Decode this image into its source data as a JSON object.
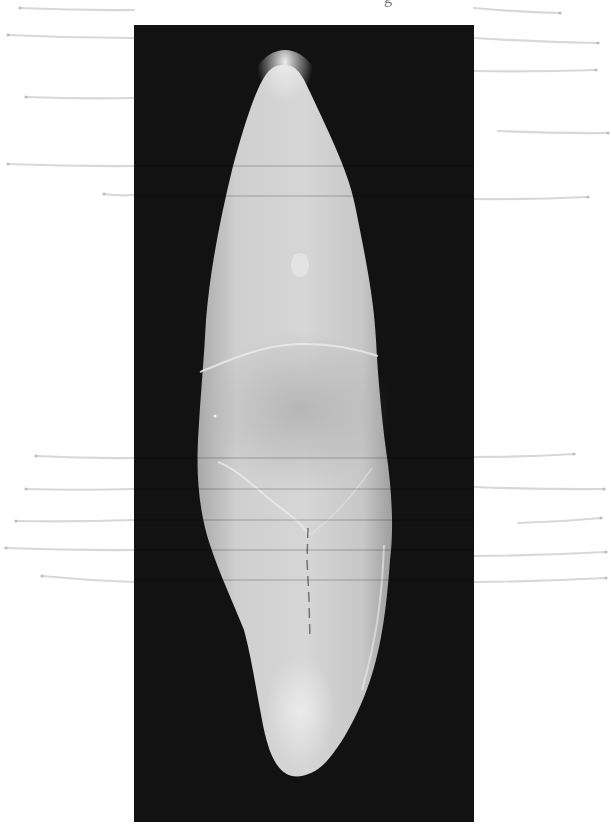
{
  "figure": {
    "caption_fragment": "g",
    "background_color": "#121212",
    "specimen_color": "#d2d2d2",
    "leader_line_color": "#d8d8d8",
    "leader_lines": {
      "left": [
        {
          "x1": 20,
          "y1": 8,
          "x2": 134,
          "y2": 10
        },
        {
          "x1": 8,
          "y1": 35,
          "x2": 134,
          "y2": 38
        },
        {
          "x1": 26,
          "y1": 97,
          "x2": 134,
          "y2": 98
        },
        {
          "x1": 8,
          "y1": 164,
          "x2": 134,
          "y2": 166
        },
        {
          "x1": 104,
          "y1": 194,
          "x2": 134,
          "y2": 195
        },
        {
          "x1": 36,
          "y1": 456,
          "x2": 134,
          "y2": 458
        },
        {
          "x1": 26,
          "y1": 489,
          "x2": 134,
          "y2": 489
        },
        {
          "x1": 16,
          "y1": 521,
          "x2": 134,
          "y2": 520
        },
        {
          "x1": 6,
          "y1": 548,
          "x2": 134,
          "y2": 550
        },
        {
          "x1": 42,
          "y1": 576,
          "x2": 134,
          "y2": 582
        }
      ],
      "right": [
        {
          "x1": 474,
          "y1": 8,
          "x2": 560,
          "y2": 13
        },
        {
          "x1": 474,
          "y1": 38,
          "x2": 598,
          "y2": 43
        },
        {
          "x1": 474,
          "y1": 71,
          "x2": 596,
          "y2": 70
        },
        {
          "x1": 498,
          "y1": 131,
          "x2": 608,
          "y2": 133
        },
        {
          "x1": 474,
          "y1": 199,
          "x2": 588,
          "y2": 197
        },
        {
          "x1": 474,
          "y1": 457,
          "x2": 574,
          "y2": 454
        },
        {
          "x1": 474,
          "y1": 487,
          "x2": 604,
          "y2": 489
        },
        {
          "x1": 518,
          "y1": 523,
          "x2": 601,
          "y2": 518
        },
        {
          "x1": 474,
          "y1": 556,
          "x2": 606,
          "y2": 552
        },
        {
          "x1": 474,
          "y1": 582,
          "x2": 606,
          "y2": 578
        }
      ]
    }
  }
}
